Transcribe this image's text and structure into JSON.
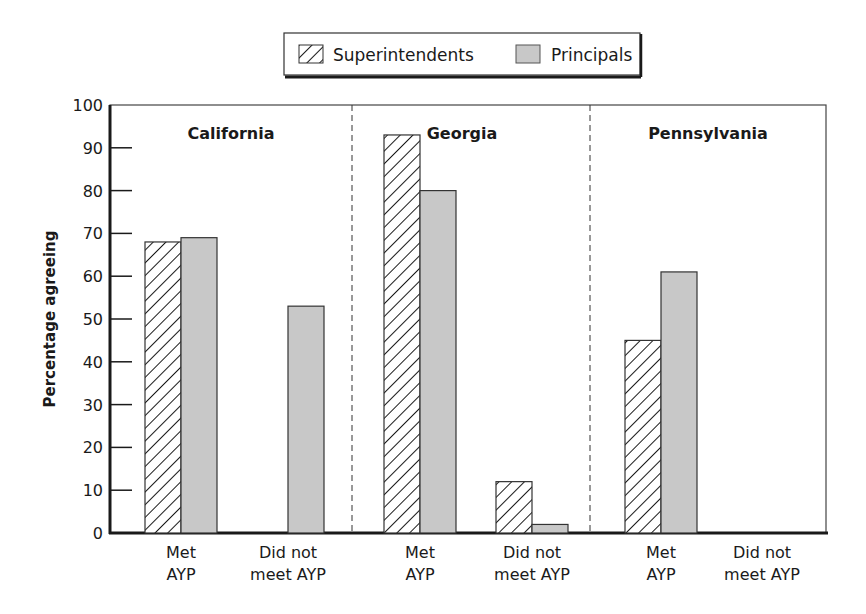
{
  "chart_data": {
    "type": "bar",
    "title": "",
    "xlabel": "",
    "ylabel": "Percentage agreeing",
    "ylim": [
      0,
      100
    ],
    "yticks": [
      0,
      10,
      20,
      30,
      40,
      50,
      60,
      70,
      80,
      90,
      100
    ],
    "grid": false,
    "legend_position": "top",
    "panels": [
      "California",
      "Georgia",
      "Pennsylvania"
    ],
    "categories": [
      "California - Met AYP",
      "California - Did not meet AYP",
      "Georgia - Met AYP",
      "Georgia - Did not meet AYP",
      "Pennsylvania - Met AYP",
      "Pennsylvania - Did not meet AYP"
    ],
    "category_labels": [
      [
        "Met",
        "AYP"
      ],
      [
        "Did not",
        "meet AYP"
      ],
      [
        "Met",
        "AYP"
      ],
      [
        "Did not",
        "meet AYP"
      ],
      [
        "Met",
        "AYP"
      ],
      [
        "Did not",
        "meet AYP"
      ]
    ],
    "series": [
      {
        "name": "Superintendents",
        "pattern": "hatched",
        "values": [
          68,
          null,
          93,
          12,
          45,
          null
        ]
      },
      {
        "name": "Principals",
        "pattern": "gray",
        "color": "#c8c8c8",
        "values": [
          69,
          53,
          80,
          2,
          61,
          null
        ]
      }
    ]
  },
  "legend": {
    "items": [
      {
        "label": "Superintendents",
        "icon": "hatched-swatch-icon"
      },
      {
        "label": "Principals",
        "icon": "gray-swatch-icon"
      }
    ]
  },
  "colors": {
    "principals_fill": "#c8c8c8",
    "axis": "#1a1a1a",
    "hatch": "#1a1a1a"
  }
}
